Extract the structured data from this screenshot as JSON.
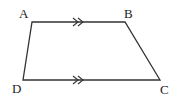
{
  "diagram": {
    "type": "trapezium",
    "stroke_color": "#333333",
    "background": "#ffffff",
    "vertices": {
      "A": {
        "label": "A",
        "x": 32,
        "y": 22
      },
      "B": {
        "label": "B",
        "x": 125,
        "y": 22
      },
      "C": {
        "label": "C",
        "x": 160,
        "y": 80
      },
      "D": {
        "label": "D",
        "x": 23,
        "y": 80
      }
    },
    "edges": [
      {
        "from": "A",
        "to": "B",
        "parallel_mark": "double-arrow"
      },
      {
        "from": "B",
        "to": "C"
      },
      {
        "from": "C",
        "to": "D",
        "parallel_mark": "double-arrow"
      },
      {
        "from": "D",
        "to": "A"
      }
    ],
    "labels": {
      "A": "A",
      "B": "B",
      "C": "C",
      "D": "D"
    }
  }
}
